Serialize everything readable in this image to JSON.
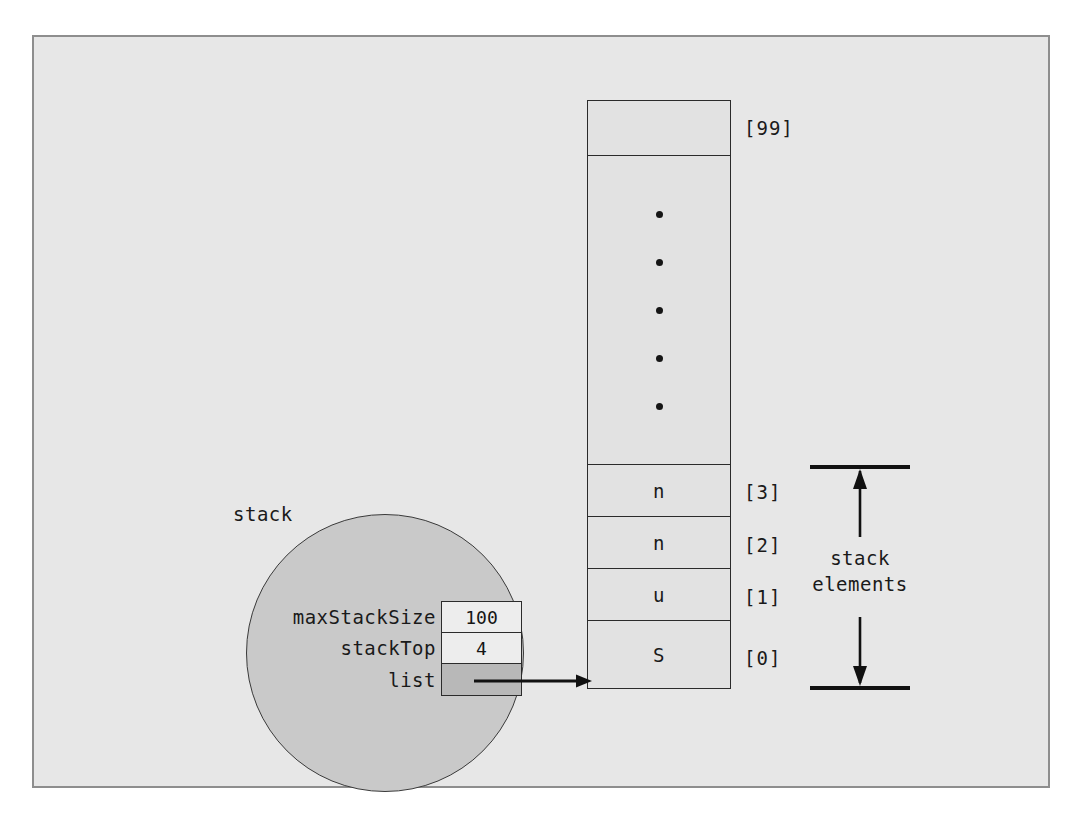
{
  "figure": {
    "background_color": "#e7e7e7",
    "border_color": "#8e8e8e"
  },
  "object": {
    "label": "stack",
    "fill_color": "#c9c9c9",
    "fields": [
      {
        "name": "maxStackSize",
        "value": "100",
        "kind": "value"
      },
      {
        "name": "stackTop",
        "value": "4",
        "kind": "value"
      },
      {
        "name": "list",
        "value": "",
        "kind": "pointer"
      }
    ]
  },
  "array": {
    "fill_color": "#e2e2e2",
    "cells": [
      {
        "index_label": "[99]",
        "value": "",
        "kind": "empty"
      },
      {
        "index_label": "",
        "value": "",
        "kind": "ellipsis"
      },
      {
        "index_label": "[3]",
        "value": "n",
        "kind": "element"
      },
      {
        "index_label": "[2]",
        "value": "n",
        "kind": "element"
      },
      {
        "index_label": "[1]",
        "value": "u",
        "kind": "element"
      },
      {
        "index_label": "[0]",
        "value": "S",
        "kind": "element"
      }
    ],
    "ellipsis_dot_count": 5
  },
  "annotation": {
    "caption_line1": "stack",
    "caption_line2": "elements",
    "arrow_style": "double-headed",
    "span_top_index": "[3]",
    "span_bottom_index": "[0]"
  }
}
